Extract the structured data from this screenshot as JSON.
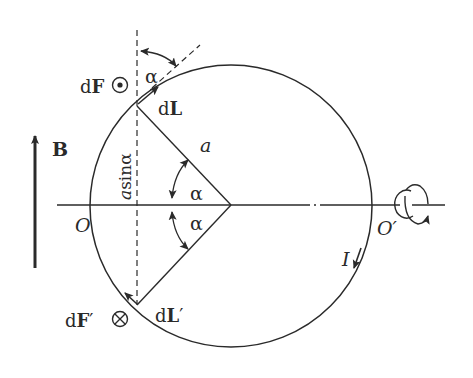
{
  "diagram": {
    "type": "circular current loop in uniform magnetic field",
    "labels": {
      "field": "B",
      "force_top": "dF",
      "force_bottom": "dF′",
      "element_top": "dL",
      "element_bottom": "dL′",
      "radius": "a",
      "angle_top_outer": "α",
      "angle_upper": "α",
      "angle_lower": "α",
      "lever_arm_a": "a",
      "lever_arm_sin": "sinα",
      "axis_left": "O",
      "axis_right": "O′",
      "current": "I"
    },
    "symbols": {
      "force_top_direction": "out-of-page-icon",
      "force_bottom_direction": "into-page-icon",
      "rotation": "rotation-arrow-icon"
    },
    "colors": {
      "ink": "#2a2a2a",
      "background": "#ffffff"
    }
  }
}
